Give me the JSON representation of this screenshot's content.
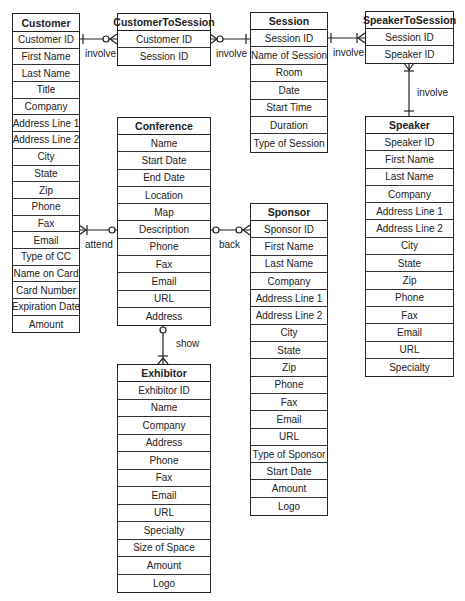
{
  "diagram": {
    "type": "entity-relationship",
    "entities": {
      "customer": {
        "title": "Customer",
        "fields": [
          "Customer ID",
          "First Name",
          "Last Name",
          "Title",
          "Company",
          "Address Line 1",
          "Address Line 2",
          "City",
          "State",
          "Zip",
          "Phone",
          "Fax",
          "Email",
          "Type of CC",
          "Name on Card",
          "Card Number",
          "Expiration Date",
          "Amount"
        ]
      },
      "customer_to_session": {
        "title": "CustomerToSession",
        "fields": [
          "Customer ID",
          "Session ID"
        ]
      },
      "session": {
        "title": "Session",
        "fields": [
          "Session ID",
          "Name of Session",
          "Room",
          "Date",
          "Start Time",
          "Duration",
          "Type of Session"
        ]
      },
      "speaker_to_session": {
        "title": "SpeakerToSession",
        "fields": [
          "Session ID",
          "Speaker ID"
        ]
      },
      "speaker": {
        "title": "Speaker",
        "fields": [
          "Speaker ID",
          "First Name",
          "Last Name",
          "Company",
          "Address Line 1",
          "Address Line 2",
          "City",
          "State",
          "Zip",
          "Phone",
          "Fax",
          "Email",
          "URL",
          "Specialty"
        ]
      },
      "conference": {
        "title": "Conference",
        "fields": [
          "Name",
          "Start Date",
          "End Date",
          "Location",
          "Map",
          "Description",
          "Phone",
          "Fax",
          "Email",
          "URL",
          "Address"
        ]
      },
      "sponsor": {
        "title": "Sponsor",
        "fields": [
          "Sponsor ID",
          "First Name",
          "Last Name",
          "Company",
          "Address Line 1",
          "Address Line 2",
          "City",
          "State",
          "Zip",
          "Phone",
          "Fax",
          "Email",
          "URL",
          "Type of Sponsor",
          "Start Date",
          "Amount",
          "Logo"
        ]
      },
      "exhibitor": {
        "title": "Exhibitor",
        "fields": [
          "Exhibitor ID",
          "Name",
          "Company",
          "Address",
          "Phone",
          "Fax",
          "Email",
          "URL",
          "Specialty",
          "Size of Space",
          "Amount",
          "Logo"
        ]
      }
    },
    "relationships": [
      {
        "label": "involve",
        "from": "Customer",
        "to": "CustomerToSession",
        "from_card": "one",
        "to_card": "zero-or-many"
      },
      {
        "label": "involve",
        "from": "CustomerToSession",
        "to": "Session",
        "from_card": "zero-or-many",
        "to_card": "one"
      },
      {
        "label": "involve",
        "from": "Session",
        "to": "SpeakerToSession",
        "from_card": "one",
        "to_card": "one-or-many"
      },
      {
        "label": "involve",
        "from": "SpeakerToSession",
        "to": "Speaker",
        "from_card": "one-or-many",
        "to_card": "one"
      },
      {
        "label": "attend",
        "from": "Customer",
        "to": "Conference",
        "from_card": "one-or-many",
        "to_card": "zero-or-one"
      },
      {
        "label": "back",
        "from": "Conference",
        "to": "Sponsor",
        "from_card": "zero-or-one",
        "to_card": "zero-or-many"
      },
      {
        "label": "show",
        "from": "Conference",
        "to": "Exhibitor",
        "from_card": "zero-or-one",
        "to_card": "one-or-many"
      }
    ]
  }
}
